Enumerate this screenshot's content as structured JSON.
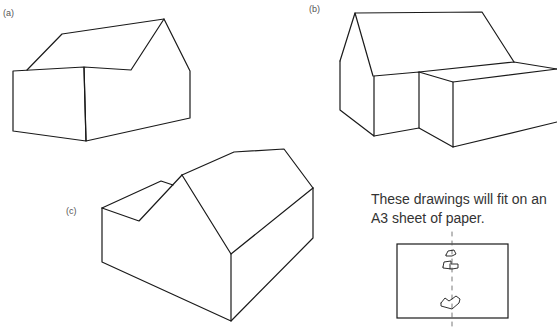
{
  "figures": {
    "a": {
      "label": "(a)"
    },
    "b": {
      "label": "(b)"
    },
    "c": {
      "label": "(c)"
    }
  },
  "caption": {
    "line1": "These drawings will fit on an",
    "line2": "A3 sheet of paper."
  },
  "colors": {
    "line": "#1a1a1a",
    "text": "#333333",
    "background": "#ffffff"
  }
}
